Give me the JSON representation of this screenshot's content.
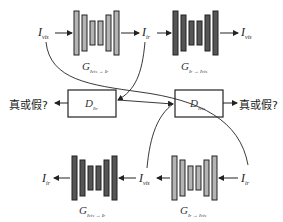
{
  "colors": {
    "light_block": "#b4b4b4",
    "dark_block": "#555555",
    "stroke": "#222222",
    "background": "#ffffff"
  },
  "top_row": {
    "input_left": {
      "main": "I",
      "sub": "vis"
    },
    "mid_label": {
      "main": "I",
      "sub": "ir"
    },
    "output_right": {
      "main": "I",
      "sub": "vis"
    },
    "generator_1": {
      "main": "G",
      "sub": "I_vis → I_ir",
      "sub_display": "Ivis → Ir"
    },
    "generator_2": {
      "main": "G",
      "sub": "I_ir → I_vis",
      "sub_display": "Ir → Ivis"
    }
  },
  "middle_row": {
    "discriminator_left": {
      "main": "D",
      "sub": "I_ir",
      "sub_display": "Iir"
    },
    "discriminator_right": {
      "main": "D",
      "sub": "I_vis",
      "sub_display": "Ivis"
    },
    "output_left": "真或假?",
    "output_right": "真或假?"
  },
  "bottom_row": {
    "output_left": {
      "main": "I",
      "sub": "ir"
    },
    "mid_label": {
      "main": "I",
      "sub": "vis"
    },
    "input_right": {
      "main": "I",
      "sub": "ir"
    },
    "generator_1": {
      "main": "G",
      "sub": "I_vis → I_ir",
      "sub_display": "Ivis → Ir"
    },
    "generator_2": {
      "main": "G",
      "sub": "I_ir → I_vis",
      "sub_display": "Ir → Ivis"
    }
  }
}
